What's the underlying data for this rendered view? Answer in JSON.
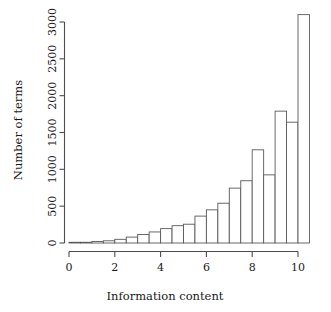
{
  "chart_data": {
    "type": "bar",
    "title": "",
    "subtitle": "",
    "xlabel": "Information content",
    "ylabel": "Number of terms",
    "xlim": [
      0,
      10.5
    ],
    "ylim": [
      0,
      3150
    ],
    "grid": false,
    "legend": null,
    "bin_width": 0.5,
    "x_ticks": [
      "0",
      "2",
      "4",
      "6",
      "8",
      "10"
    ],
    "x_tick_values": [
      0,
      2,
      4,
      6,
      8,
      10
    ],
    "y_ticks": [
      "0",
      "500",
      "1000",
      "1500",
      "2000",
      "2500",
      "3000"
    ],
    "y_tick_values": [
      0,
      500,
      1000,
      1500,
      2000,
      2500,
      3000
    ],
    "bin_starts": [
      0,
      0.5,
      1,
      1.5,
      2,
      2.5,
      3,
      3.5,
      4,
      4.5,
      5,
      5.5,
      6,
      6.5,
      7,
      7.5,
      8,
      8.5,
      9,
      9.5,
      10
    ],
    "categories": [
      "0-0.5",
      "0.5-1",
      "1-1.5",
      "1.5-2",
      "2-2.5",
      "2.5-3",
      "3-3.5",
      "3.5-4",
      "4-4.5",
      "4.5-5",
      "5-5.5",
      "5.5-6",
      "6-6.5",
      "6.5-7",
      "7-7.5",
      "7.5-8",
      "8-8.5",
      "8.5-9",
      "9-9.5",
      "9.5-10",
      "10-10.5"
    ],
    "values": [
      2,
      8,
      20,
      30,
      50,
      80,
      115,
      150,
      195,
      235,
      255,
      365,
      450,
      540,
      745,
      845,
      1265,
      925,
      1790,
      1640,
      3100
    ]
  },
  "axis": {
    "x_label": "Information content",
    "y_label": "Number of terms"
  }
}
